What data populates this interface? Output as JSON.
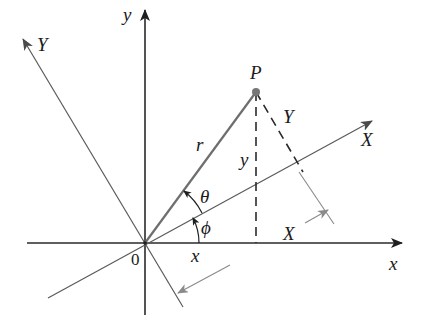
{
  "diagram": {
    "type": "rotation-of-axes",
    "origin_label": "0",
    "axes": {
      "x_label": "x",
      "y_label": "y",
      "X_label": "X",
      "Y_label": "Y"
    },
    "point": {
      "label": "P"
    },
    "segments": {
      "r_label": "r",
      "y_label": "y",
      "x_label": "x",
      "X_label": "X",
      "Y_label": "Y"
    },
    "angles": {
      "theta_label": "θ",
      "phi_label": "ϕ"
    },
    "colors": {
      "axis": "#2a2a2a",
      "rotated_axis": "#5a5a5a",
      "radius": "#6e6e6e",
      "point": "#777777",
      "dimension": "#8a8a8a"
    }
  }
}
